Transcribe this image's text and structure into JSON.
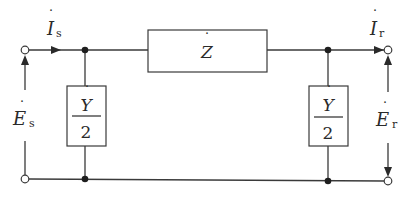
{
  "diagram": {
    "type": "pi-equivalent-circuit",
    "colors": {
      "line": "#3a3a3a",
      "text": "#2a2a2a",
      "background": "#ffffff"
    },
    "series_element": {
      "symbol": "Z",
      "dot": "˙",
      "label": "Ż"
    },
    "shunt_left": {
      "numerator": "Y",
      "denominator": "2",
      "label": "Ẏ/2"
    },
    "shunt_right": {
      "numerator": "Y",
      "denominator": "2",
      "label": "Ẏ/2"
    },
    "current_send": {
      "symbol": "I",
      "subscript": "s",
      "label": "İs"
    },
    "current_recv": {
      "symbol": "I",
      "subscript": "r",
      "label": "İr"
    },
    "voltage_send": {
      "symbol": "E",
      "subscript": "s",
      "label": "Ės"
    },
    "voltage_recv": {
      "symbol": "E",
      "subscript": "r",
      "label": "Ėr"
    }
  }
}
